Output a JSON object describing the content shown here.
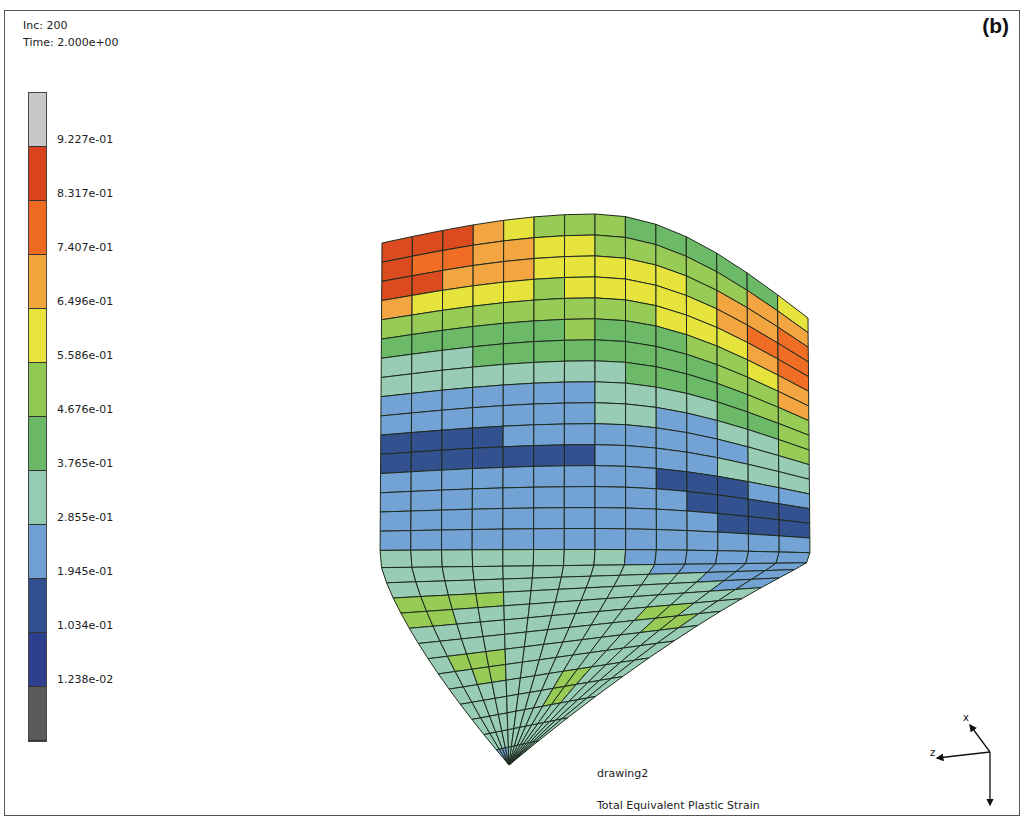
{
  "header": {
    "inc_label": "Inc:",
    "inc_value": "200",
    "time_label": "Time:",
    "time_value": "2.000e+00",
    "panel_label": "(b)"
  },
  "legend": {
    "title": "Total Equivalent Plastic Strain",
    "segments": [
      {
        "color": "#c8c8c8"
      },
      {
        "color": "#d9441f"
      },
      {
        "color": "#ee6a22"
      },
      {
        "color": "#f3a53d"
      },
      {
        "color": "#e8e43c"
      },
      {
        "color": "#8fc852"
      },
      {
        "color": "#6bb866"
      },
      {
        "color": "#95cbb3"
      },
      {
        "color": "#6f9fd4"
      },
      {
        "color": "#324f92"
      },
      {
        "color": "#2e3f8f"
      },
      {
        "color": "#5a5a5a"
      }
    ],
    "labels": [
      "9.227e-01",
      "8.317e-01",
      "7.407e-01",
      "6.496e-01",
      "5.586e-01",
      "4.676e-01",
      "3.765e-01",
      "2.855e-01",
      "1.945e-01",
      "1.034e-01",
      "1.238e-02"
    ]
  },
  "model": {
    "name": "drawing2",
    "variable": "Total Equivalent Plastic Strain",
    "level_colors": {
      "R": "#dc4a20",
      "O": "#ef6d24",
      "A": "#f2a540",
      "Y": "#e7e33d",
      "L": "#97cb55",
      "G": "#6cb968",
      "T": "#98ccb4",
      "B": "#73a2d4",
      "D": "#33508f"
    },
    "rows": [
      "RRRAYLLLGGGGGY",
      "ROOAAYYLLLLLAA",
      "RRAAAYYYYYLAAO",
      "AYYYYLYYYYYAOO",
      "LLLLLLLLLYYYAO",
      "GGGGGGLGGGLLYA",
      "TTTGGGGGGGGLLA",
      "TTTTTTTTGGGGLL",
      "BBBBBBBTTTTGGL",
      "BBBBBBBTTBBTTL",
      "DDDDBBBBBBBBTT",
      "DDDDDDDBBBBTTT",
      "BBBBBBBBBDDDBB",
      "BBBBBBBBBBDDDD",
      "BBBBBBBBBBBDDD",
      "BBBBBBBBBBBBBB",
      "TTTTTTTTBBBBBB",
      "TTTTTTTTTBBBBB",
      "TTTTTTTTTTTBBB",
      "LLLLTTTTTTTTBB",
      "LLTTTTTTTTTTTT",
      "TTTTTTTTTTLLTT",
      "TTTTTTTTTTTLLT",
      "TLLLTTTTTTTTTT",
      "TTLLTTTTTTTTTT",
      "TTTTTTTTLLTTTT",
      "TTTTTTTTLLTTTT",
      "TTTTTTTTTTTTTT",
      "TTTTTTTTTTTTTT",
      "BBBBTTTTTTTTTT"
    ]
  },
  "triad": {
    "x_label": "x",
    "y_label": "y",
    "z_label": "z"
  }
}
